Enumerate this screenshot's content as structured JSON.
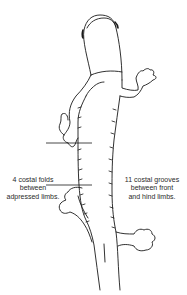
{
  "diagram": {
    "colors": {
      "line": "#1a1a1a",
      "background": "#ffffff",
      "text": "#2a2a2a"
    },
    "annotations": {
      "left": {
        "text": "4 costal folds\nbetween\nadpressed limbs."
      },
      "right": {
        "text": "11 costal grooves\nbetween front\nand hind limbs."
      }
    },
    "reference_lines": [
      {
        "name": "upper-line",
        "y": 143
      },
      {
        "name": "lower-line",
        "y": 185
      }
    ]
  }
}
